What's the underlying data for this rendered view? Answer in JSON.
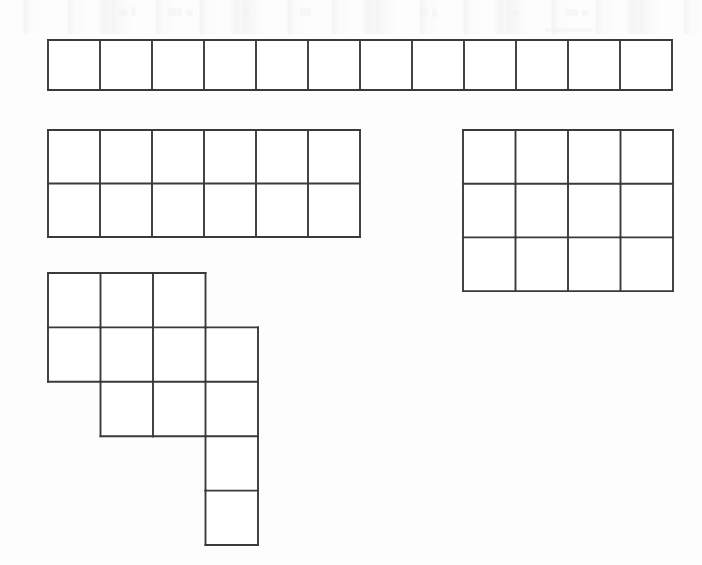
{
  "document": {
    "title": "Grid Shapes Worksheet",
    "description": "Four outlined unit-square grid figures drawn on a plain white page",
    "background_color": "#fdfdfd",
    "line_color": "#3a3a3a",
    "fill_color": "#ffffff",
    "line_width": 1.9,
    "canvas": {
      "width": 702,
      "height": 565
    }
  },
  "shapes": [
    {
      "id": "strip-1x12",
      "name": "horizontal-strip",
      "label": "Shape A",
      "rows": 1,
      "cols": 12,
      "cell_count": 12,
      "origin_x": 48,
      "origin_y": 40,
      "cell_w": 52.0,
      "cell_h": 50.0,
      "filled_cells": [
        [
          0,
          0
        ],
        [
          0,
          1
        ],
        [
          0,
          2
        ],
        [
          0,
          3
        ],
        [
          0,
          4
        ],
        [
          0,
          5
        ],
        [
          0,
          6
        ],
        [
          0,
          7
        ],
        [
          0,
          8
        ],
        [
          0,
          9
        ],
        [
          0,
          10
        ],
        [
          0,
          11
        ]
      ]
    },
    {
      "id": "rect-2x6",
      "name": "rectangle-six-by-two",
      "label": "Shape B",
      "rows": 2,
      "cols": 6,
      "cell_count": 12,
      "origin_x": 48,
      "origin_y": 130,
      "cell_w": 52.0,
      "cell_h": 53.5,
      "filled_cells": [
        [
          0,
          0
        ],
        [
          0,
          1
        ],
        [
          0,
          2
        ],
        [
          0,
          3
        ],
        [
          0,
          4
        ],
        [
          0,
          5
        ],
        [
          1,
          0
        ],
        [
          1,
          1
        ],
        [
          1,
          2
        ],
        [
          1,
          3
        ],
        [
          1,
          4
        ],
        [
          1,
          5
        ]
      ]
    },
    {
      "id": "rect-3x4",
      "name": "rectangle-four-by-three",
      "label": "Shape C",
      "rows": 3,
      "cols": 4,
      "cell_count": 12,
      "origin_x": 463,
      "origin_y": 130,
      "cell_w": 52.5,
      "cell_h": 53.7,
      "filled_cells": [
        [
          0,
          0
        ],
        [
          0,
          1
        ],
        [
          0,
          2
        ],
        [
          0,
          3
        ],
        [
          1,
          0
        ],
        [
          1,
          1
        ],
        [
          1,
          2
        ],
        [
          1,
          3
        ],
        [
          2,
          0
        ],
        [
          2,
          1
        ],
        [
          2,
          2
        ],
        [
          2,
          3
        ]
      ]
    },
    {
      "id": "staircase-polyomino",
      "name": "staircase-polyomino",
      "label": "Shape D",
      "rows": 5,
      "cols": 4,
      "cell_count": 12,
      "origin_x": 48,
      "origin_y": 273,
      "cell_w": 52.5,
      "cell_h": 54.4,
      "filled_cells": [
        [
          0,
          0
        ],
        [
          0,
          1
        ],
        [
          0,
          2
        ],
        [
          1,
          0
        ],
        [
          1,
          1
        ],
        [
          1,
          2
        ],
        [
          1,
          3
        ],
        [
          2,
          1
        ],
        [
          2,
          2
        ],
        [
          2,
          3
        ],
        [
          3,
          3
        ],
        [
          4,
          3
        ]
      ]
    }
  ]
}
